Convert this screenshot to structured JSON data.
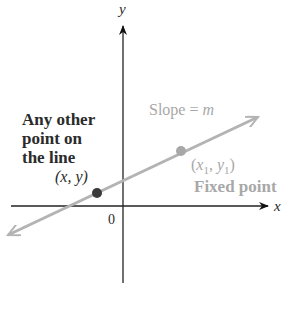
{
  "diagram": {
    "axes": {
      "x_label": "x",
      "y_label": "y",
      "origin_label": "0"
    },
    "line": {
      "slope_label_prefix": "Slope = ",
      "slope_label_var": "m",
      "color": "#b3b3b3"
    },
    "points": [
      {
        "name": "any-point",
        "caption_lines": [
          "Any other",
          "point on",
          "the line"
        ],
        "coord_label": "(x, y)",
        "color": "#3a3a3a"
      },
      {
        "name": "fixed-point",
        "caption_lines": [
          "Fixed point"
        ],
        "coord_label_parts": {
          "open": "(",
          "x": "x",
          "sub1": "1",
          "sep": ", ",
          "y": "y",
          "sub2": "1",
          "close": ")"
        },
        "color": "#a8a8a8"
      }
    ],
    "colors": {
      "axis": "#222222",
      "dark_text": "#2b2b2b",
      "gray_text": "#a8a8a8"
    }
  }
}
